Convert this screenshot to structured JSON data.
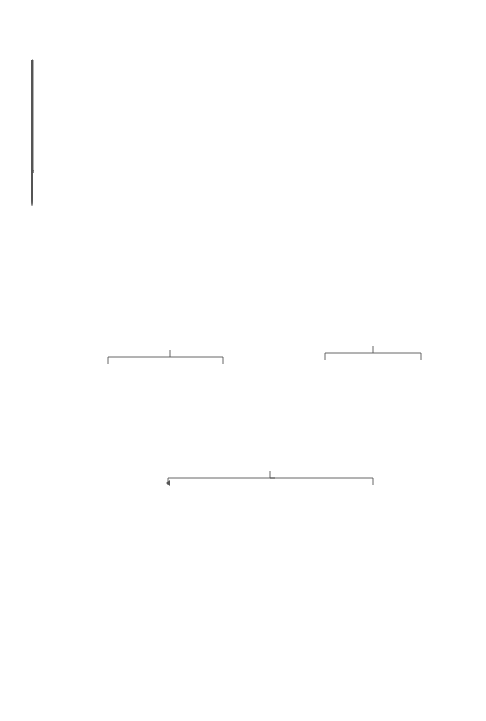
{
  "figure": {
    "caption": "Fig. 2.14 Metabolism of cortisone",
    "legend": [
      {
        "symbol": "●",
        "label": "Found in adrenals"
      },
      {
        "symbol": "*",
        "label": "Found in urine"
      }
    ]
  },
  "compounds": {
    "cortisone": {
      "lines": [
        "Cortisone",
        "4-Pregnen-17α,21-diol-",
        "3,11,20-trione"
      ]
    },
    "prednisone": {
      "lines": [
        "Prednisone",
        "1,2-Dehydrocortisone"
      ]
    },
    "allodihydro": {
      "lines": [
        "5α-Pregnan-17α,21-diol-3,11,20-trione",
        "Allodihydrocortisone",
        "5α-Dihydrocortisone"
      ]
    },
    "dihydro": {
      "lines": [
        "5β-Pregnan-17α,21-diol-3,11-20-trione",
        "Dihydrocortisone*"
      ]
    },
    "reichsteinD": {
      "lines": [
        "5α-Pregnan-3β,17α,21-triol-11,20-dione",
        "Reichstein D ●"
      ]
    },
    "alloTHE": {
      "lines": [
        "5α-Pregnan-3α,17α,21-triol-11,20-dione●"
      ]
    },
    "beta5_3b": {
      "lines": [
        "5β-Pregnan-3β,17α,21-triol-11,20-dione"
      ]
    },
    "THE": {
      "lines": [
        "5β-Pregnan-3α,17α,21-triol-11,20-dione",
        "Tetrahydrocortisone",
        "Urocortisone*"
      ]
    },
    "reichsteinU": {
      "lines": [
        "4-Pregnen-17α,20β,21-triol-3,11-dione",
        "Reichstein U ● *"
      ]
    },
    "pregnen20a": {
      "lines": [
        "4-Pregnen-17α,20α,21-triol-3,11-dione"
      ]
    },
    "a3b20b": {
      "lines": [
        "5α-Pregnan-3β,17α,20β,21-tetrol-11-one"
      ]
    },
    "a3b20a": {
      "lines": [
        "5α-Pregnan-3β,17α,20α,21-tetrol-11-one"
      ]
    },
    "a3a20b": {
      "lines": [
        "5α-Pregnan-3α,17α,20β,21-tetrol-11-one",
        "β-Allocortisone"
      ]
    },
    "a3a20a": {
      "lines": [
        "5α-Pregnan-3α,17α,20α,21-tetrol-11-one",
        "Allocortolone"
      ]
    },
    "b3b20b": {
      "lines": [
        "5β-Pregnan-3β,17α,20β,21-tetrol-11-one"
      ]
    },
    "b3b20a": {
      "lines": [
        "5β-Pregnan-3β,17α,20α,21, tetrol-11-one"
      ]
    },
    "b3a20b": {
      "lines": [
        "5β-Pregnan-3α,17α,20β,21-tetrol-11-one",
        "β-Cortolone*"
      ]
    },
    "b3a20a": {
      "lines": [
        "5β-Pregnan-3α,17α,20α,21-tetrol-11-one",
        "Cortolone*"
      ]
    }
  },
  "reactions": {
    "delta4": {
      "top": "+ 2H",
      "bottom": "at Δ⁴",
      "branch_a": "5α",
      "branch_a_sub": "allo",
      "branch_b": "5β"
    },
    "c3_alpha": {
      "top": "+ 2H",
      "bottom": "at C-3",
      "branch_a": "3β",
      "branch_b": "3α"
    },
    "c3_beta": {
      "top": "+ 2H at",
      "bottom": "C-3",
      "branch_a": "3β",
      "branch_b": "3α"
    },
    "c20": {
      "label": "+ 2H at C-20",
      "branch_a": "20β",
      "branch_b": "20α"
    }
  },
  "atoms": {
    "ch2oh": "CH₂OH",
    "c": "C",
    "o": "O",
    "oh": "OH",
    "h": "H",
    "ho": "HO"
  }
}
